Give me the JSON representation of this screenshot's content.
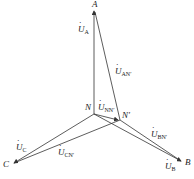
{
  "diagram": {
    "points": {
      "A": {
        "label": "A",
        "x": 94,
        "y": 8
      },
      "B": {
        "label": "B",
        "x": 183,
        "y": 163
      },
      "C": {
        "label": "C",
        "x": 12,
        "y": 165
      },
      "N": {
        "label": "N",
        "x": 94,
        "y": 114
      },
      "N_prime": {
        "label": "N′",
        "x": 120,
        "y": 120
      }
    },
    "vectors": [
      {
        "name": "U_A",
        "from": "N",
        "to": "A",
        "label_main": "U",
        "label_sub": "A"
      },
      {
        "name": "U_B",
        "from": "N",
        "to": "B",
        "label_main": "U",
        "label_sub": "B"
      },
      {
        "name": "U_C",
        "from": "N",
        "to": "C",
        "label_main": "U",
        "label_sub": "C"
      },
      {
        "name": "U_NN'",
        "from": "N",
        "to": "N_prime",
        "label_main": "U",
        "label_sub": "NN′"
      },
      {
        "name": "U_AN'",
        "from": "N_prime",
        "to": "A",
        "label_main": "U",
        "label_sub": "AN′"
      },
      {
        "name": "U_BN'",
        "from": "N_prime",
        "to": "B",
        "label_main": "U",
        "label_sub": "BN′"
      },
      {
        "name": "U_CN'",
        "from": "N_prime",
        "to": "C",
        "label_main": "U",
        "label_sub": "CN′"
      }
    ],
    "labels": {
      "A": "A",
      "B": "B",
      "C": "C",
      "N": "N",
      "Np": "N′",
      "UA_main": "U",
      "UA_sub": "A",
      "UB_main": "U",
      "UB_sub": "B",
      "UC_main": "U",
      "UC_sub": "C",
      "UNN_main": "U",
      "UNN_sub": "NN′",
      "UAN_main": "U",
      "UAN_sub": "AN′",
      "UBN_main": "U",
      "UBN_sub": "BN′",
      "UCN_main": "U",
      "UCN_sub": "CN′"
    },
    "line_color": "#333333"
  }
}
